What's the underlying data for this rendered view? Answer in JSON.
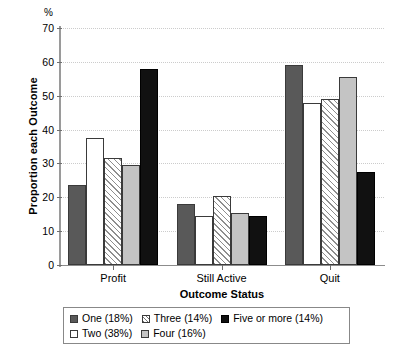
{
  "chart_data": {
    "type": "bar",
    "title": "",
    "subtitle": "",
    "xlabel": "Outcome Status",
    "ylabel": "Proportion each Outcome",
    "unit_symbol": "%",
    "categories": [
      "Profit",
      "Still Active",
      "Quit"
    ],
    "series": [
      {
        "name": "One (18%)",
        "values": [
          23.5,
          18.0,
          59.0
        ]
      },
      {
        "name": "Two (38%)",
        "values": [
          37.5,
          14.5,
          48.0
        ]
      },
      {
        "name": "Three (14%)",
        "values": [
          31.5,
          20.5,
          49.0
        ]
      },
      {
        "name": "Four (16%)",
        "values": [
          29.5,
          15.5,
          55.5
        ]
      },
      {
        "name": "Five or more (14%)",
        "values": [
          58.0,
          14.5,
          27.5
        ]
      }
    ],
    "ylim": [
      0,
      70
    ],
    "yticks": [
      0,
      10,
      20,
      30,
      40,
      50,
      60,
      70
    ],
    "ytick_labels": [
      "0",
      "10",
      "20",
      "30",
      "40",
      "50",
      "60",
      "70"
    ],
    "grid": true,
    "grid_style": "dotted",
    "legend_position": "bottom",
    "legend_rows": [
      [
        "One (18%)",
        "Three (14%)",
        "Five or more (14%)"
      ],
      [
        "Two (38%)",
        "Four (16%)"
      ]
    ],
    "colors": {
      "series_one": "#595959",
      "series_two": "#ffffff",
      "series_three": "#ffffff",
      "series_four": "#c4c4c4",
      "series_five_or_more": "#111111",
      "axis": "#8c8c8c",
      "grid": "#cccccc",
      "text": "#000000"
    }
  }
}
